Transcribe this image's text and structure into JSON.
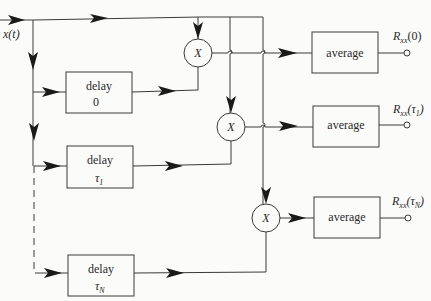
{
  "input": {
    "label": "x(t)"
  },
  "delays": [
    {
      "title": "delay",
      "value": "0"
    },
    {
      "title": "delay",
      "value": "τ",
      "sub": "1"
    },
    {
      "title": "delay",
      "value": "τ",
      "sub": "N"
    }
  ],
  "multipliers": [
    {
      "label": "X"
    },
    {
      "label": "X"
    },
    {
      "label": "X"
    }
  ],
  "averages": [
    {
      "label": "average"
    },
    {
      "label": "average"
    },
    {
      "label": "average"
    }
  ],
  "outputs": [
    {
      "label": "R",
      "sub": "xx",
      "arg": "(0)"
    },
    {
      "label": "R",
      "sub": "xx",
      "arg": "(τ",
      "argsub": "1",
      "close": ")"
    },
    {
      "label": "R",
      "sub": "xx",
      "arg": "(τ",
      "argsub": "N",
      "close": ")"
    }
  ],
  "colors": {
    "line": "#3a3a3a",
    "arrow": "#1a1a1a",
    "background": "#fbfbf9"
  }
}
